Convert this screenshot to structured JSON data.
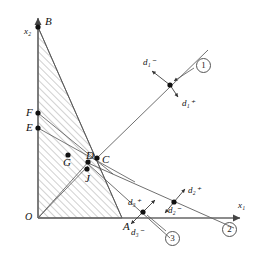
{
  "figure": {
    "background": "#ffffff",
    "line_color": "#555555",
    "axis_color": "#666666",
    "hatch_color": "#8a8a8a",
    "point_color": "#111111",
    "width": 266,
    "height": 261
  },
  "axes": {
    "x_label": "x₁",
    "y_label": "x₂",
    "origin_label": "O",
    "x_axis": {
      "x1": 38,
      "y1": 218,
      "x2": 240,
      "y2": 218
    },
    "y_axis": {
      "x1": 38,
      "y1": 218,
      "x2": 38,
      "y2": 18
    }
  },
  "points": [
    {
      "id": "B",
      "label": "B",
      "x": 38,
      "y": 27,
      "label_dx": 7,
      "label_dy": -11,
      "dot": true
    },
    {
      "id": "F",
      "label": "F",
      "x": 38,
      "y": 113,
      "label_dx": -12,
      "label_dy": -6,
      "dot": true
    },
    {
      "id": "E",
      "label": "E",
      "x": 38,
      "y": 128,
      "label_dx": -12,
      "label_dy": -6,
      "dot": true
    },
    {
      "id": "G",
      "label": "G",
      "x": 68,
      "y": 155,
      "label_dx": -5,
      "label_dy": 2,
      "dot": true
    },
    {
      "id": "D",
      "label": "D",
      "x": 88,
      "y": 162,
      "label_dx": -2,
      "label_dy": -12,
      "dot": true
    },
    {
      "id": "C",
      "label": "C",
      "x": 97,
      "y": 158,
      "label_dx": 5,
      "label_dy": -4,
      "dot": true
    },
    {
      "id": "J",
      "label": "J",
      "x": 87,
      "y": 169,
      "label_dx": -2,
      "label_dy": 4,
      "dot": true
    },
    {
      "id": "A",
      "label": "A",
      "x": 122,
      "y": 218,
      "label_dx": 1,
      "label_dy": 3,
      "dot": false
    }
  ],
  "goal_lines": [
    {
      "id": "line1",
      "marker": "①",
      "marker_x": 196,
      "marker_y": 58,
      "node_x": 170,
      "node_y": 85,
      "path": {
        "x1": 97,
        "y1": 158,
        "x2": 208,
        "y2": 50
      },
      "positive_dev": {
        "label": "d₁⁺",
        "label_x": 182,
        "label_y": 99,
        "ax": 178,
        "ay": 97
      },
      "negative_dev": {
        "label": "d₁⁻",
        "label_x": 143,
        "label_y": 58,
        "ax": 152,
        "ay": 71
      }
    },
    {
      "id": "line2",
      "marker": "②",
      "marker_x": 222,
      "marker_y": 222,
      "node_x": 174,
      "node_y": 202,
      "path": {
        "x1": 88,
        "y1": 163,
        "x2": 234,
        "y2": 228
      },
      "positive_dev": {
        "label": "d₂⁺",
        "label_x": 188,
        "label_y": 186,
        "ax": 185,
        "ay": 189
      },
      "negative_dev": {
        "label": "d₂⁻",
        "label_x": 168,
        "label_y": 206,
        "ax": 165,
        "ay": 213
      }
    },
    {
      "id": "line3",
      "marker": "③",
      "marker_x": 165,
      "marker_y": 231,
      "node_x": 143,
      "node_y": 212,
      "path": {
        "x1": 88,
        "y1": 164,
        "x2": 170,
        "y2": 238
      },
      "positive_dev": {
        "label": "d₃⁺",
        "label_x": 128,
        "label_y": 198,
        "ax": 155,
        "ay": 200
      },
      "negative_dev": {
        "label": "d₃⁻",
        "label_x": 131,
        "label_y": 228,
        "ax": 131,
        "ay": 224
      }
    }
  ],
  "region": {
    "name": "feasible-region",
    "hatched": true,
    "vertices": "38,27 122,218 38,218",
    "boundary_lines": [
      {
        "from": "B",
        "to": "A",
        "x1": 38,
        "y1": 27,
        "x2": 122,
        "y2": 218
      },
      {
        "from": "F",
        "to": "C",
        "x1": 38,
        "y1": 113,
        "x2": 113,
        "y2": 174
      },
      {
        "from": "E",
        "to": "J",
        "x1": 38,
        "y1": 128,
        "x2": 135,
        "y2": 182
      },
      {
        "from": "O",
        "to": "D",
        "x1": 38,
        "y1": 218,
        "x2": 90,
        "y2": 160
      },
      {
        "from": "O",
        "to": "J",
        "x1": 38,
        "y1": 218,
        "x2": 88,
        "y2": 166
      }
    ]
  }
}
